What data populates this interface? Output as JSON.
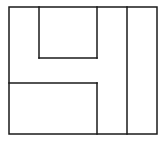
{
  "diagram": {
    "stroke_color": "#1a1a1a",
    "background": "#ffffff",
    "stroke_width": 1.5,
    "outer_frame": {
      "x1": 9,
      "y1": 7,
      "x2": 157,
      "y2": 134
    },
    "segments": [
      {
        "id": "inner-top-box-left",
        "x1": 39,
        "y1": 7,
        "x2": 39,
        "y2": 58
      },
      {
        "id": "inner-top-box-bottom",
        "x1": 39,
        "y1": 58,
        "x2": 97,
        "y2": 58
      },
      {
        "id": "inner-top-box-right",
        "x1": 97,
        "y1": 7,
        "x2": 97,
        "y2": 58
      },
      {
        "id": "lower-box-top",
        "x1": 9,
        "y1": 83,
        "x2": 97,
        "y2": 83
      },
      {
        "id": "lower-box-right",
        "x1": 97,
        "y1": 83,
        "x2": 97,
        "y2": 134
      },
      {
        "id": "right-column-divider",
        "x1": 127,
        "y1": 7,
        "x2": 127,
        "y2": 134
      }
    ]
  }
}
